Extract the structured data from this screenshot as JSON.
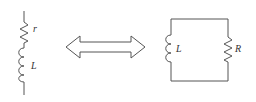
{
  "diagram": {
    "left_circuit": {
      "type": "series",
      "components": [
        {
          "kind": "resistor",
          "label": "r"
        },
        {
          "kind": "inductor",
          "label": "L"
        }
      ]
    },
    "equivalence_symbol": "double-headed-arrow",
    "right_circuit": {
      "type": "parallel",
      "components": [
        {
          "kind": "inductor",
          "label": "L"
        },
        {
          "kind": "resistor",
          "label": "R"
        }
      ]
    },
    "colors": {
      "stroke": "#555555",
      "background": "#ffffff"
    }
  }
}
